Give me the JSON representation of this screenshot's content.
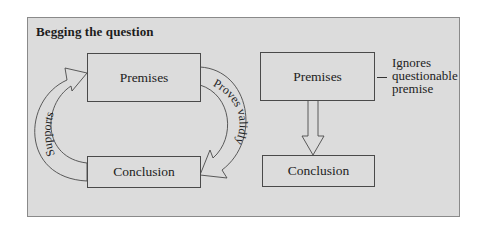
{
  "title": "Begging the question",
  "left_diagram": {
    "top_box": "Premises",
    "bottom_box": "Conclusion",
    "right_arrow_label": "Proves validly",
    "left_arrow_label": "Supports"
  },
  "right_diagram": {
    "top_box": "Premises",
    "bottom_box": "Conclusion",
    "annotation_lines": [
      "Ignores",
      "questionable",
      "premise"
    ]
  },
  "colors": {
    "panel_bg": "#dcdcdc",
    "stroke": "#4a4a4a",
    "text": "#222222"
  }
}
